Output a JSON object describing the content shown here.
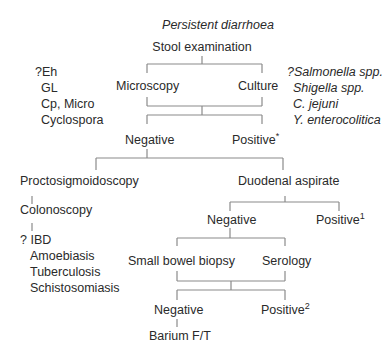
{
  "title": "Persistent diarrhoea",
  "root": "Stool examination",
  "level1": {
    "left": "Microscopy",
    "right": "Culture",
    "left_notes": [
      "?Eh",
      "GL",
      "Cp, Micro",
      "Cyclospora"
    ],
    "right_notes": [
      "?Salmonella spp.",
      "Shigella spp.",
      "C. jejuni",
      "Y. enterocolitica"
    ]
  },
  "level2": {
    "negative": "Negative",
    "positive": "Positive",
    "positive_mark": "*"
  },
  "left_branch": {
    "step1": "Proctosigmoidoscopy",
    "step2": "Colonoscopy",
    "outcomes": [
      "? IBD",
      "Amoebiasis",
      "Tuberculosis",
      "Schistosomiasis"
    ]
  },
  "right_branch": {
    "step1": "Duodenal aspirate",
    "negative": "Negative",
    "positive": "Positive",
    "positive_mark": "1",
    "tests_left": "Small bowel biopsy",
    "tests_right": "Serology",
    "final_negative": "Negative",
    "final_positive": "Positive",
    "final_positive_mark": "2",
    "last_step": "Barium F/T"
  }
}
